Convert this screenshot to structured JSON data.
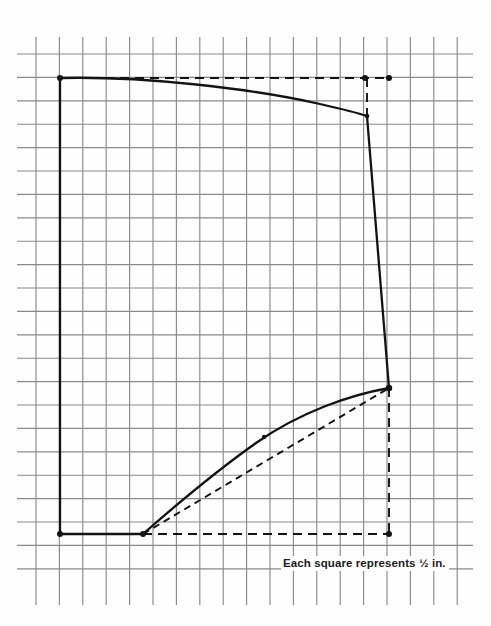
{
  "figure": {
    "caption": "Each square represents ½ in.",
    "grid": {
      "spacing_px": 23.4,
      "square_represents": "½ in.",
      "x_start": 36,
      "x_end": 457,
      "y_start": 54,
      "y_end": 583,
      "n_vertical_lines": 19,
      "n_horizontal_lines": 23,
      "line_color": "#8a8a8a",
      "tick_color": "#6f6f6f"
    },
    "colors": {
      "outline": "#131313",
      "dashed": "#131313",
      "grid": "#8a8a8a",
      "background": "#fefefe",
      "text": "#1b1b1b"
    },
    "outline": {
      "name": "pattern-outline",
      "stroke_width": 2.3,
      "path": "M 60 78 C 140 76 250 88 320 104 C 342 109 358 113 367 116 L 389 388 C 350 395 300 412 256 443 C 208 477 168 512 143 534 L 60 534 Z"
    },
    "dashed_lines": [
      {
        "name": "top-guide",
        "x1": 60,
        "y1": 78,
        "x2": 389,
        "y2": 78
      },
      {
        "name": "right-upper-guide",
        "x1": 367,
        "y1": 78,
        "x2": 367,
        "y2": 117
      },
      {
        "name": "bottom-guide",
        "x1": 143,
        "y1": 534,
        "x2": 389,
        "y2": 534
      },
      {
        "name": "right-lower-guide",
        "x1": 389,
        "y1": 388,
        "x2": 389,
        "y2": 534
      },
      {
        "name": "chord-guide",
        "x1": 143,
        "y1": 534,
        "x2": 389,
        "y2": 388
      }
    ],
    "points": [
      {
        "name": "point-top-left",
        "x": 60,
        "y": 78,
        "r": 3.0
      },
      {
        "name": "point-top-curve-end",
        "x": 365,
        "y": 78,
        "r": 3.0
      },
      {
        "name": "point-top-right",
        "x": 389,
        "y": 78,
        "r": 3.0
      },
      {
        "name": "point-curve-corner",
        "x": 367,
        "y": 116,
        "r": 2.3
      },
      {
        "name": "point-right-vertex",
        "x": 389,
        "y": 388,
        "r": 3.2
      },
      {
        "name": "point-lower-curve-mid",
        "x": 264,
        "y": 437,
        "r": 2.2
      },
      {
        "name": "point-bottom-curve-start",
        "x": 143,
        "y": 534,
        "r": 3.0
      },
      {
        "name": "point-bottom-left",
        "x": 60,
        "y": 534,
        "r": 3.0
      },
      {
        "name": "point-bottom-right",
        "x": 389,
        "y": 534,
        "r": 3.0
      }
    ]
  },
  "chart_data": {
    "type": "line",
    "xlabel": "",
    "ylabel": "",
    "annotations": [
      "Each square represents ½ in."
    ],
    "grid": true,
    "legend": "none",
    "xlim": [
      36,
      457
    ],
    "ylim": [
      54,
      583
    ],
    "series": [
      {
        "name": "pattern-outline-solid",
        "style": "solid",
        "x": [
          60,
          143,
          180,
          220,
          264,
          310,
          350,
          389,
          367,
          320,
          230,
          150,
          60,
          60
        ],
        "y": [
          78,
          534,
          507,
          477,
          437,
          412,
          396,
          388,
          116,
          104,
          85,
          77,
          78,
          534
        ]
      },
      {
        "name": "top-guide-dashed",
        "style": "dashed",
        "x": [
          60,
          389
        ],
        "y": [
          78,
          78
        ]
      },
      {
        "name": "bottom-guide-dashed",
        "style": "dashed",
        "x": [
          143,
          389
        ],
        "y": [
          534,
          534
        ]
      },
      {
        "name": "chord-guide-dashed",
        "style": "dashed",
        "x": [
          143,
          389
        ],
        "y": [
          534,
          388
        ]
      },
      {
        "name": "right-lower-guide-dashed",
        "style": "dashed",
        "x": [
          389,
          389
        ],
        "y": [
          388,
          534
        ]
      },
      {
        "name": "right-upper-guide-dashed",
        "style": "dashed",
        "x": [
          367,
          367
        ],
        "y": [
          78,
          117
        ]
      }
    ]
  }
}
